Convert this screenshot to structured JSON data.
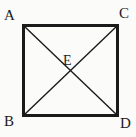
{
  "figure": {
    "shape": "square",
    "background_color": "#fbfbfa",
    "stroke_color": "#1a1a1a",
    "square": {
      "left": 22,
      "top": 24,
      "right": 119,
      "bottom": 117,
      "border_width": 3
    },
    "diagonals": {
      "count": 2,
      "line_width": 1.4,
      "paths": [
        {
          "name": "diagonal-A-D",
          "x1": 23,
          "y1": 25,
          "x2": 118,
          "y2": 116
        },
        {
          "name": "diagonal-C-B",
          "x1": 118,
          "y1": 25,
          "x2": 23,
          "y2": 116
        }
      ]
    },
    "labels": {
      "a": "A",
      "c": "C",
      "b": "B",
      "d": "D",
      "e": "E"
    },
    "vertices": [
      {
        "label": "A",
        "position": "top-left",
        "x": 22,
        "y": 24
      },
      {
        "label": "C",
        "position": "top-right",
        "x": 119,
        "y": 24
      },
      {
        "label": "B",
        "position": "bottom-left",
        "x": 22,
        "y": 117
      },
      {
        "label": "D",
        "position": "bottom-right",
        "x": 119,
        "y": 117
      },
      {
        "label": "E",
        "position": "center",
        "x": 70,
        "y": 70
      }
    ]
  }
}
